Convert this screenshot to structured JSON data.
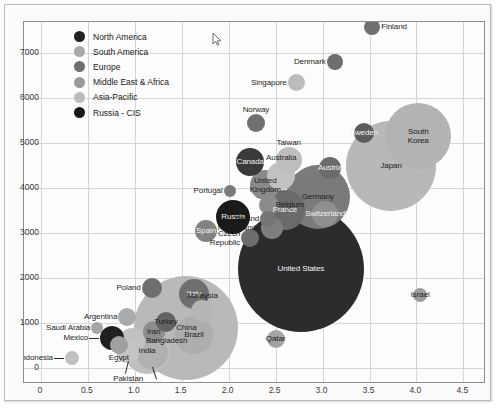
{
  "chart_data": {
    "type": "scatter",
    "title": "",
    "xlabel": "",
    "ylabel": "",
    "xlim": [
      -0.18,
      4.72
    ],
    "ylim": [
      -320,
      7680
    ],
    "grid": true,
    "legend_position": "top-left",
    "xticks": [
      "0",
      "0.5",
      "1.0",
      "1.5",
      "2.0",
      "2.5",
      "3.0",
      "3.5",
      "4.0",
      "4.5"
    ],
    "xtick_values": [
      0,
      0.5,
      1.0,
      1.5,
      2.0,
      2.5,
      3.0,
      3.5,
      4.0,
      4.5
    ],
    "yticks": [
      "0",
      "1000",
      "2000",
      "3000",
      "4000",
      "5000",
      "6000",
      "7000"
    ],
    "ytick_values": [
      0,
      1000,
      2000,
      3000,
      4000,
      5000,
      6000,
      7000
    ],
    "legend": [
      {
        "label": "North America",
        "color": "#221f1f"
      },
      {
        "label": "South America",
        "color": "#a8a8a8"
      },
      {
        "label": "Europe",
        "color": "#6f6f6f"
      },
      {
        "label": "Middle East & Africa",
        "color": "#9a9a9a"
      },
      {
        "label": "Asia-Pacific",
        "color": "#bcbcbc"
      },
      {
        "label": "Russia - CIS",
        "color": "#191919"
      }
    ],
    "points": [
      {
        "name": "Finland",
        "x": 3.53,
        "y": 7560,
        "r": 8,
        "group": "Europe",
        "color": "#6f6f6f",
        "label_pos": "right",
        "label_color": "dark"
      },
      {
        "name": "Denmark",
        "x": 3.13,
        "y": 6790,
        "r": 8,
        "group": "Europe",
        "color": "#6f6f6f",
        "label_pos": "left",
        "label_color": "dark"
      },
      {
        "name": "Singapore",
        "x": 2.72,
        "y": 6330,
        "r": 8.5,
        "group": "Asia-Pacific",
        "color": "#bcbcbc",
        "label_pos": "left",
        "label_color": "dark"
      },
      {
        "name": "Norway",
        "x": 2.29,
        "y": 5430,
        "r": 9,
        "group": "Europe",
        "color": "#6f6f6f",
        "label_pos": "above",
        "label_color": "dark"
      },
      {
        "name": "Sweden",
        "x": 3.44,
        "y": 5210,
        "r": 10,
        "group": "Europe",
        "color": "#5c5c5c",
        "label_pos": "in",
        "label_color": "light"
      },
      {
        "name": "South Korea",
        "x": 4.02,
        "y": 5150,
        "r": 33,
        "group": "Asia-Pacific",
        "color": "#b3b3b3",
        "label_pos": "in",
        "label_color": "dark"
      },
      {
        "name": "Japan",
        "x": 3.73,
        "y": 4470,
        "r": 45,
        "group": "Asia-Pacific",
        "color": "#b8b8b8",
        "label_pos": "in",
        "label_color": "dark"
      },
      {
        "name": "Canada",
        "x": 2.23,
        "y": 4560,
        "r": 14,
        "group": "North America",
        "color": "#3a3a3a",
        "label_pos": "in",
        "label_color": "light"
      },
      {
        "name": "Taiwan",
        "x": 2.64,
        "y": 4620,
        "r": 13,
        "group": "Asia-Pacific",
        "color": "#bdbdbd",
        "label_pos": "above",
        "label_color": "dark"
      },
      {
        "name": "Austria",
        "x": 3.08,
        "y": 4430,
        "r": 11,
        "group": "Europe",
        "color": "#6b6b6b",
        "label_pos": "in",
        "label_color": "light"
      },
      {
        "name": "Australia",
        "x": 2.56,
        "y": 4260,
        "r": 14,
        "group": "Asia-Pacific",
        "color": "#c2c2c2",
        "label_pos": "above",
        "label_color": "dark"
      },
      {
        "name": "United Kingdom",
        "x": 2.39,
        "y": 4060,
        "r": 15,
        "group": "Europe",
        "color": "#8a8a8a",
        "label_pos": "in",
        "label_color": "dark"
      },
      {
        "name": "Germany",
        "x": 2.95,
        "y": 3800,
        "r": 32,
        "group": "Europe",
        "color": "#7a7a7a",
        "label_pos": "in",
        "label_color": "dark"
      },
      {
        "name": "Switzerland",
        "x": 3.03,
        "y": 3420,
        "r": 13,
        "group": "Europe",
        "color": "#8f8f8f",
        "label_pos": "in",
        "label_color": "light"
      },
      {
        "name": "Portugal",
        "x": 2.01,
        "y": 3930,
        "r": 6,
        "group": "Europe",
        "color": "#7c7c7c",
        "label_pos": "left",
        "label_color": "dark"
      },
      {
        "name": "Belgium",
        "x": 2.43,
        "y": 3620,
        "r": 10,
        "group": "Europe",
        "color": "#8b8b8b",
        "label_pos": "in",
        "label_color": "dark"
      },
      {
        "name": "France",
        "x": 2.6,
        "y": 3500,
        "r": 20,
        "group": "Europe",
        "color": "#6a6a6a",
        "label_pos": "in",
        "label_color": "light"
      },
      {
        "name": "Russia",
        "x": 2.05,
        "y": 3350,
        "r": 17,
        "group": "Russia - CIS",
        "color": "#1a1a1a",
        "label_pos": "in",
        "label_color": "light"
      },
      {
        "name": "Ireland",
        "x": 2.42,
        "y": 3310,
        "r": 8,
        "group": "Europe",
        "color": "#757575",
        "label_pos": "left",
        "label_color": "dark"
      },
      {
        "name": "Netherlands",
        "x": 2.46,
        "y": 3110,
        "r": 11,
        "group": "Europe",
        "color": "#7e7e7e",
        "label_pos": "left",
        "label_color": "dark"
      },
      {
        "name": "Spain",
        "x": 1.76,
        "y": 3030,
        "r": 11,
        "group": "Europe",
        "color": "#828282",
        "label_pos": "in",
        "label_color": "light"
      },
      {
        "name": "Czech Republic",
        "x": 2.23,
        "y": 2870,
        "r": 9,
        "group": "Europe",
        "color": "#6d6d6d",
        "label_pos": "left",
        "label_color": "dark"
      },
      {
        "name": "United States",
        "x": 2.77,
        "y": 2200,
        "r": 63,
        "group": "North America",
        "color": "#2c2c2c",
        "label_pos": "in",
        "label_color": "light"
      },
      {
        "name": "Israel",
        "x": 4.04,
        "y": 1620,
        "r": 7,
        "group": "Middle East & Africa",
        "color": "#9d9d9d",
        "label_pos": "in",
        "label_color": "dark"
      },
      {
        "name": "Poland",
        "x": 1.18,
        "y": 1780,
        "r": 10,
        "group": "Europe",
        "color": "#6f6f6f",
        "label_pos": "left",
        "label_color": "dark"
      },
      {
        "name": "Italy",
        "x": 1.63,
        "y": 1630,
        "r": 15,
        "group": "Europe",
        "color": "#6e6e6e",
        "label_pos": "in",
        "label_color": "light"
      },
      {
        "name": "Malaysia",
        "x": 1.72,
        "y": 1260,
        "r": 11,
        "group": "Asia-Pacific",
        "color": "#b5b5b5",
        "label_pos": "above",
        "label_color": "dark"
      },
      {
        "name": "Argentina",
        "x": 0.92,
        "y": 1130,
        "r": 9,
        "group": "South America",
        "color": "#ababab",
        "label_pos": "left",
        "label_color": "dark"
      },
      {
        "name": "Turkey",
        "x": 1.33,
        "y": 1020,
        "r": 10,
        "group": "Europe",
        "color": "#636363",
        "label_pos": "in",
        "label_color": "dark"
      },
      {
        "name": "Saudi Arabia",
        "x": 0.6,
        "y": 870,
        "r": 6,
        "group": "Middle East & Africa",
        "color": "#a5a5a5",
        "label_pos": "left",
        "label_color": "dark"
      },
      {
        "name": "Iran",
        "x": 1.2,
        "y": 800,
        "r": 11,
        "group": "Middle East & Africa",
        "color": "#8d8d8d",
        "label_pos": "in",
        "label_color": "dark"
      },
      {
        "name": "Brazil",
        "x": 1.63,
        "y": 720,
        "r": 19,
        "group": "South America",
        "color": "#adadad",
        "label_pos": "in",
        "label_color": "dark"
      },
      {
        "name": "Mexico",
        "x": 0.76,
        "y": 650,
        "r": 12,
        "group": "North America",
        "color": "#1f1f1f",
        "label_pos": "leader-left",
        "label_color": "dark"
      },
      {
        "name": "Bangladesh",
        "x": 0.97,
        "y": 600,
        "r": 13,
        "group": "Asia-Pacific",
        "color": "#c1c1c1",
        "label_pos": "right",
        "label_color": "dark"
      },
      {
        "name": "Egypt",
        "x": 0.83,
        "y": 500,
        "r": 9,
        "group": "Middle East & Africa",
        "color": "#a0a0a0",
        "label_pos": "below",
        "label_color": "dark"
      },
      {
        "name": "China",
        "x": 1.55,
        "y": 880,
        "r": 52,
        "group": "Asia-Pacific",
        "color": "#b9b9b9",
        "label_pos": "in",
        "label_color": "dark"
      },
      {
        "name": "Qatar",
        "x": 2.5,
        "y": 640,
        "r": 9,
        "group": "Middle East & Africa",
        "color": "#a4a4a4",
        "label_pos": "in",
        "label_color": "dark"
      },
      {
        "name": "India",
        "x": 1.13,
        "y": 360,
        "r": 23,
        "group": "Asia-Pacific",
        "color": "#bfbfbf",
        "label_pos": "in",
        "label_color": "dark"
      },
      {
        "name": "Pakistan",
        "x": 0.93,
        "y": 380,
        "r": 12,
        "group": "Asia-Pacific",
        "color": "#c4c4c4",
        "label_pos": "leader-below",
        "label_color": "dark"
      },
      {
        "name": "South Africa",
        "x": 1.18,
        "y": 330,
        "r": 16,
        "group": "Middle East & Africa",
        "color": "#b0b0b0",
        "label_pos": "leader-below",
        "label_color": "dark"
      },
      {
        "name": "Indonesia",
        "x": 0.33,
        "y": 210,
        "r": 7,
        "group": "Asia-Pacific",
        "color": "#c0c0c0",
        "label_pos": "leader-left",
        "label_color": "dark"
      }
    ]
  },
  "cursor": {
    "name": "mouse-pointer",
    "x": 207,
    "y": 27
  }
}
